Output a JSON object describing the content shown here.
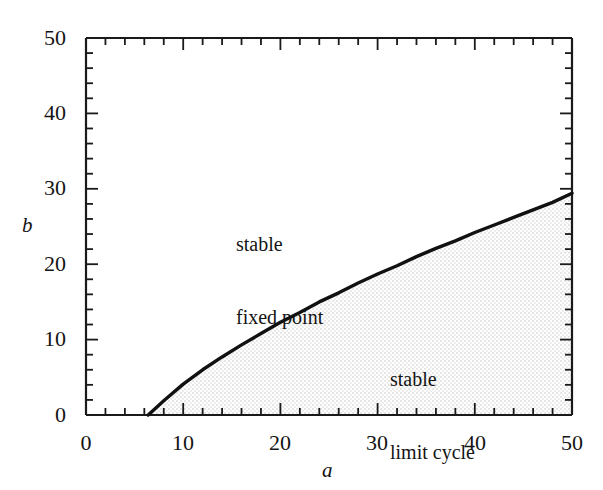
{
  "chart_data": {
    "type": "line",
    "title": "",
    "subtitle": "",
    "xlabel": "a",
    "ylabel": "b",
    "xlim": [
      0,
      50
    ],
    "ylim": [
      0,
      50
    ],
    "grid": false,
    "legend": "none",
    "xticks": [
      0,
      10,
      20,
      30,
      40,
      50
    ],
    "yticks": [
      0,
      10,
      20,
      30,
      40,
      50
    ],
    "xtick_labels": [
      "0",
      "10",
      "20",
      "30",
      "40",
      "50"
    ],
    "ytick_labels": [
      "0",
      "10",
      "20",
      "30",
      "40",
      "50"
    ],
    "minor_tick_step": 2,
    "series": [
      {
        "name": "Hopf bifurcation curve",
        "x": [
          6.4,
          8,
          10,
          12,
          14,
          16,
          18,
          20,
          22,
          24,
          26,
          28,
          30,
          32,
          34,
          36,
          38,
          40,
          42,
          44,
          46,
          48,
          50
        ],
        "y": [
          0.0,
          1.9,
          4.1,
          6.0,
          7.7,
          9.3,
          10.8,
          12.3,
          13.6,
          15.0,
          16.2,
          17.5,
          18.7,
          19.8,
          21.0,
          22.1,
          23.1,
          24.2,
          25.2,
          26.2,
          27.2,
          28.2,
          29.4
        ]
      }
    ],
    "annotations": [
      {
        "id": "stable-fixed-point",
        "lines": [
          "stable",
          "fixed point"
        ],
        "x": 20,
        "y": 29,
        "region": "above-curve"
      },
      {
        "id": "stable-limit-cycle",
        "lines": [
          "stable",
          "limit cycle"
        ],
        "x": 36,
        "y": 12,
        "region": "below-curve-shaded"
      }
    ],
    "shaded_region": {
      "name": "stable limit cycle region",
      "description": "stippled light gray fill below the bifurcation curve",
      "color": "#f2f2f2"
    },
    "colors": {
      "axis": "#1a1a1a",
      "curve": "#111111",
      "shading": "#f2f2f2",
      "background": "#ffffff"
    }
  }
}
